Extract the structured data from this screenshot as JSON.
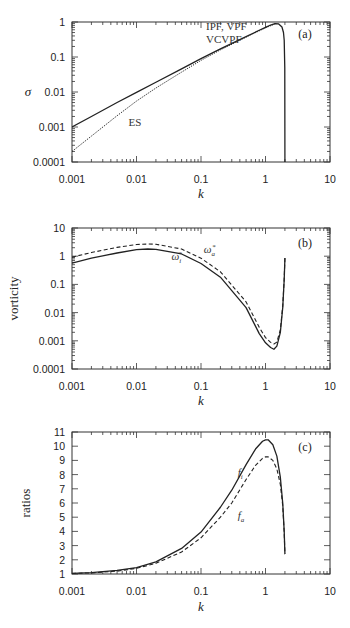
{
  "chart_data": [
    {
      "panel": "(a)",
      "type": "line",
      "xscale": "log",
      "yscale": "log",
      "xlabel": "k",
      "ylabel": "σ",
      "xlim": [
        0.001,
        10
      ],
      "ylim": [
        0.0001,
        1
      ],
      "xticks": [
        "0.001",
        "0.01",
        "0.1",
        "1",
        "10"
      ],
      "yticks": [
        "0.0001",
        "0.001",
        "0.01",
        "0.1",
        "1"
      ],
      "annotations": [
        {
          "text": "IPF, VPF",
          "k": 0.12,
          "y": 0.6
        },
        {
          "text": "VCVPF",
          "k": 0.12,
          "y": 0.25
        },
        {
          "text": "ES",
          "k": 0.0075,
          "y": 0.0011
        }
      ],
      "series": [
        {
          "name": "IPF, VPF, VCVPF",
          "style": "solid",
          "x": [
            0.001,
            0.002,
            0.005,
            0.01,
            0.02,
            0.05,
            0.1,
            0.2,
            0.5,
            0.8,
            1.0,
            1.2,
            1.4,
            1.6,
            1.8,
            1.9,
            1.95,
            1.99,
            2.0
          ],
          "y": [
            0.001,
            0.002,
            0.005,
            0.0098,
            0.019,
            0.046,
            0.09,
            0.17,
            0.38,
            0.58,
            0.7,
            0.82,
            0.9,
            0.88,
            0.72,
            0.5,
            0.3,
            0.05,
            0.0001
          ]
        },
        {
          "name": "ES",
          "style": "dotted",
          "x": [
            0.001,
            0.002,
            0.005,
            0.01,
            0.02,
            0.05,
            0.1,
            0.2,
            0.5,
            1.0,
            1.4
          ],
          "y": [
            0.0002,
            0.00055,
            0.0021,
            0.0055,
            0.013,
            0.037,
            0.08,
            0.16,
            0.37,
            0.68,
            0.88
          ]
        }
      ]
    },
    {
      "panel": "(b)",
      "type": "line",
      "xscale": "log",
      "yscale": "log",
      "xlabel": "k",
      "ylabel": "vorticity",
      "xlim": [
        0.001,
        10
      ],
      "ylim": [
        0.0001,
        10
      ],
      "xticks": [
        "0.001",
        "0.01",
        "0.1",
        "1",
        "10"
      ],
      "yticks": [
        "0.0001",
        "0.001",
        "0.01",
        "0.1",
        "1",
        "10"
      ],
      "annotations": [
        {
          "text": "ω",
          "sub": "i",
          "sup": "*",
          "k": 0.035,
          "y": 0.75
        },
        {
          "text": "ω",
          "sub": "a",
          "sup": "*",
          "k": 0.11,
          "y": 1.25
        }
      ],
      "series": [
        {
          "name": "ω_i*",
          "style": "solid",
          "x": [
            0.001,
            0.002,
            0.005,
            0.01,
            0.015,
            0.02,
            0.05,
            0.1,
            0.2,
            0.5,
            0.8,
            1.0,
            1.2,
            1.35,
            1.5,
            1.7,
            1.85,
            1.95,
            2.0
          ],
          "y": [
            0.57,
            0.85,
            1.3,
            1.7,
            1.8,
            1.75,
            1.2,
            0.55,
            0.18,
            0.015,
            0.0018,
            0.00085,
            0.00058,
            0.0005,
            0.00065,
            0.002,
            0.015,
            0.15,
            0.87
          ]
        },
        {
          "name": "ω_a*",
          "style": "dashed",
          "x": [
            0.001,
            0.002,
            0.005,
            0.01,
            0.015,
            0.02,
            0.05,
            0.1,
            0.2,
            0.5,
            0.8,
            1.0,
            1.2,
            1.35,
            1.5,
            1.7,
            1.85,
            1.95,
            2.0
          ],
          "y": [
            0.93,
            1.35,
            2.05,
            2.6,
            2.7,
            2.65,
            1.8,
            0.85,
            0.28,
            0.024,
            0.003,
            0.0013,
            0.00088,
            0.00077,
            0.0009,
            0.0025,
            0.017,
            0.16,
            0.87
          ]
        }
      ]
    },
    {
      "panel": "(c)",
      "type": "line",
      "xscale": "log",
      "yscale": "linear",
      "xlabel": "k",
      "ylabel": "ratios",
      "xlim": [
        0.001,
        10
      ],
      "ylim": [
        1,
        11
      ],
      "xticks": [
        "0.001",
        "0.01",
        "0.1",
        "1",
        "10"
      ],
      "yticks": [
        "1",
        "2",
        "3",
        "4",
        "5",
        "6",
        "7",
        "8",
        "9",
        "10",
        "11"
      ],
      "annotations": [
        {
          "text": "f",
          "sub": "i",
          "k": 0.37,
          "y": 7.9
        },
        {
          "text": "f",
          "sub": "a",
          "k": 0.37,
          "y": 4.9
        }
      ],
      "series": [
        {
          "name": "f_i",
          "style": "solid",
          "x": [
            0.001,
            0.002,
            0.005,
            0.01,
            0.02,
            0.05,
            0.1,
            0.2,
            0.3,
            0.5,
            0.7,
            0.9,
            1.0,
            1.1,
            1.3,
            1.5,
            1.7,
            1.85,
            1.95,
            2.0
          ],
          "y": [
            1.05,
            1.1,
            1.25,
            1.45,
            1.85,
            2.8,
            3.95,
            5.7,
            6.9,
            8.7,
            9.8,
            10.35,
            10.45,
            10.45,
            10.1,
            9.3,
            7.8,
            6.0,
            4.0,
            2.4
          ]
        },
        {
          "name": "f_a",
          "style": "dashed",
          "x": [
            0.001,
            0.002,
            0.005,
            0.01,
            0.02,
            0.05,
            0.1,
            0.2,
            0.3,
            0.5,
            0.7,
            0.9,
            1.0,
            1.1,
            1.3,
            1.5,
            1.7,
            1.85,
            1.95,
            2.0
          ],
          "y": [
            1.04,
            1.08,
            1.2,
            1.4,
            1.75,
            2.55,
            3.55,
            5.0,
            6.0,
            7.65,
            8.65,
            9.15,
            9.25,
            9.25,
            9.0,
            8.4,
            7.3,
            5.8,
            3.9,
            2.4
          ]
        }
      ]
    }
  ]
}
